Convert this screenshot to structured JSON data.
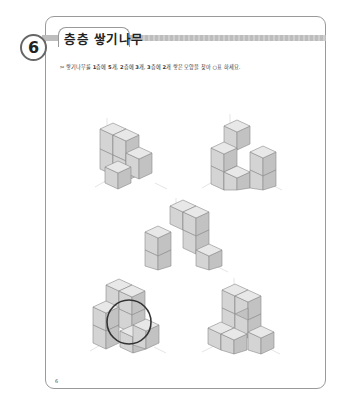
{
  "header": {
    "problem_number": "6",
    "title": "층층 쌓기나무"
  },
  "instruction": {
    "prefix": "✂",
    "parts": [
      "쌓기나무를 ",
      "1",
      "층에 ",
      "5",
      "개, ",
      "2",
      "층에 ",
      "3",
      "개, ",
      "3",
      "층에 ",
      "2",
      "개 쌓은 모양을 찾아 ○표 하세요."
    ]
  },
  "figures": [
    {
      "id": "a",
      "position": "top-left",
      "circled": false
    },
    {
      "id": "b",
      "position": "top-right",
      "circled": false
    },
    {
      "id": "c",
      "position": "middle",
      "circled": false
    },
    {
      "id": "d",
      "position": "bottom-left",
      "circled": true
    },
    {
      "id": "e",
      "position": "bottom-right",
      "circled": false
    }
  ],
  "footer": {
    "page_number": "6"
  },
  "colors": {
    "border": "#9a9a9a",
    "cube_top": "#e8e8e8",
    "cube_left": "#d4d4d4",
    "cube_right": "#c2c2c2",
    "answer_circle": "#333333"
  }
}
